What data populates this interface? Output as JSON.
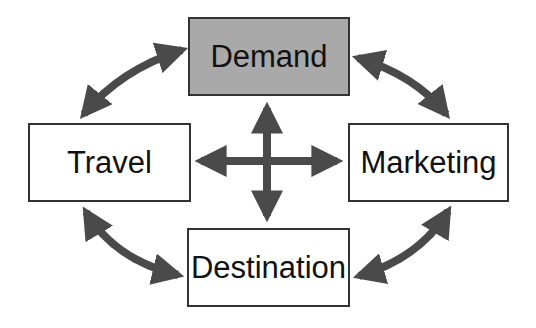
{
  "diagram": {
    "colors": {
      "arrow": "#4a4a4a",
      "border": "#333333",
      "shaded_fill": "#a9a9a9",
      "box_fill": "#ffffff"
    },
    "nodes": [
      {
        "id": "demand",
        "label": "Demand",
        "shaded": true
      },
      {
        "id": "travel",
        "label": "Travel",
        "shaded": false
      },
      {
        "id": "marketing",
        "label": "Marketing",
        "shaded": false
      },
      {
        "id": "destination",
        "label": "Destination",
        "shaded": false
      }
    ],
    "edges": [
      {
        "from": "demand",
        "to": "travel",
        "type": "bidirectional-curved"
      },
      {
        "from": "demand",
        "to": "marketing",
        "type": "bidirectional-curved"
      },
      {
        "from": "travel",
        "to": "destination",
        "type": "bidirectional-curved"
      },
      {
        "from": "marketing",
        "to": "destination",
        "type": "bidirectional-curved"
      },
      {
        "from": "demand",
        "to": "destination",
        "type": "bidirectional-straight"
      },
      {
        "from": "travel",
        "to": "marketing",
        "type": "bidirectional-straight"
      }
    ]
  }
}
